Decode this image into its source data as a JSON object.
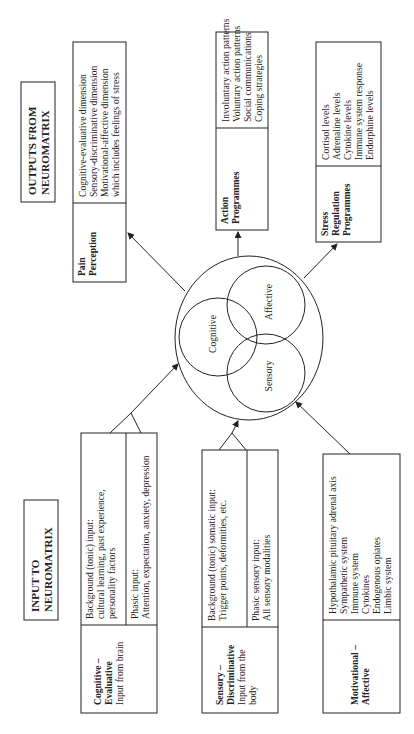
{
  "outputs": {
    "title_line1": "OUTPUTS FROM",
    "title_line2": "NEUROMATRIX",
    "pain": {
      "label_line1": "Pain",
      "label_line2": "Perception",
      "items": [
        "Cognitive-evaluative dimension",
        "Sensory-discriminative dimension",
        "Motivational-affective dimension",
        "which includes feelings of stress"
      ]
    },
    "action": {
      "label_line1": "Action",
      "label_line2": "Programmes",
      "items": [
        "Involuntary action patterns",
        "Voluntary action patterns",
        "Social communications",
        "Coping strategies"
      ]
    },
    "stress": {
      "label_line1": "Stress",
      "label_line2": "Regulation",
      "label_line3": "Programmes",
      "items": [
        "Cortisol levels",
        "Adrenaline levels",
        "Cytokine levels",
        "Immune system response",
        "Endorphine levels"
      ]
    }
  },
  "neuromatrix": {
    "circles": [
      "Cognitive",
      "Affective",
      "Sensory"
    ]
  },
  "inputs": {
    "title_line1": "INPUT TO",
    "title_line2": "NEUROMATRIX",
    "cognitive": {
      "label_line1": "Cognitive –",
      "label_line2": "Evaluative",
      "sub": "Input from brain",
      "background": [
        "Background (tonic) input:",
        "cultural learning, past experience,",
        "personality factors"
      ],
      "phasic": [
        "Phasic input:",
        "Attention, expectation, anxiety, depression"
      ]
    },
    "sensory": {
      "label_line1": "Sensory –",
      "label_line2": "Discriminative",
      "sub_line1": "Input from the",
      "sub_line2": "body",
      "background": [
        "Background (tonic) somatic input:",
        "Trigger points, deformities, etc."
      ],
      "phasic": [
        "Phasic sensory input:",
        "All sensory modalities"
      ]
    },
    "motivational": {
      "label_line1": "Motivational –",
      "label_line2": "Affective",
      "items": [
        "Hypothalamic pituitary adrenal axis",
        "Sympathetic system",
        "Immune system",
        "Cytokines",
        "Endogenous opiates",
        "Limbic system"
      ]
    }
  },
  "colors": {
    "line": "#222222",
    "background": "#ffffff"
  }
}
